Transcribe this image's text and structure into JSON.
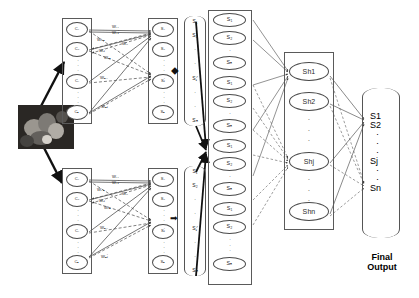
{
  "figure": {
    "background_color": "#ffffff",
    "line_color": "#3a3a3a"
  },
  "input_image": {
    "name": "input-sample-image",
    "description": "grayscale microscopy thumbnail"
  },
  "blocks": [
    {
      "id": "upper-block",
      "input_layer": {
        "label": "cluster-layer",
        "nodes": [
          "C₁",
          "C₂",
          "Cᵢ",
          "Cₙ"
        ],
        "ellipsis": [
          "·",
          "·",
          "·"
        ]
      },
      "output_layer": {
        "label": "score-layer",
        "nodes": [
          "S₁",
          "S₂",
          "Sⱼ",
          "Sₙ"
        ],
        "ellipsis": [
          "·",
          "·",
          "·"
        ]
      },
      "weights": [
        "W₁₁",
        "W₁ⱼ",
        "W₁ₙ",
        "Wᵢ₁",
        "Wᵢⱼ",
        "Wᵢₙ",
        "Wₙ₁",
        "Wₙⱼ"
      ],
      "vector": {
        "items": [
          "S₁",
          "S₂",
          "·",
          "·",
          "Sⱼ'",
          "·",
          "·",
          "Sₙ"
        ]
      },
      "connector_symbol": "⬥"
    },
    {
      "id": "lower-block",
      "input_layer": {
        "label": "cluster-layer",
        "nodes": [
          "C₁",
          "C₂",
          "Cᵢ",
          "Cₙ"
        ],
        "ellipsis": [
          "·",
          "·",
          "·"
        ]
      },
      "output_layer": {
        "label": "score-layer",
        "nodes": [
          "S₁",
          "S₂",
          "Sⱼ",
          "Sₙ"
        ],
        "ellipsis": [
          "·",
          "·",
          "·"
        ]
      },
      "weights": [
        "W₁₁",
        "W₁ⱼ",
        "W₁ₙ",
        "Wᵢ₁",
        "Wᵢⱼ",
        "Wᵢₙ",
        "Wₙ₁",
        "Wₙⱼ"
      ],
      "vector": {
        "items": [
          "S₁",
          "S₂",
          "·",
          "·",
          "Sⱼ'",
          "·",
          "·",
          "Sₙ"
        ]
      },
      "connector_symbol": "➡"
    }
  ],
  "concat_layer": {
    "label": "concatenated-input-layer",
    "nodes": [
      "S₁",
      "S₂",
      "Sₙ",
      "S₁",
      "S₂",
      "Sₙ",
      "S₁",
      "S₂",
      "Sₙ",
      "S₁",
      "S₂",
      "Sₙ"
    ],
    "group_gaps": [
      2,
      5,
      8
    ],
    "tail_ellipsis": [
      "·",
      "·"
    ]
  },
  "hidden_layer": {
    "label": "hidden-layer",
    "nodes": [
      "Sh1",
      "Sh2",
      "Shj",
      "Shn"
    ],
    "ellipsis_upper": [
      "·",
      "·",
      "·"
    ],
    "ellipsis_lower": [
      "·",
      "·",
      "·"
    ]
  },
  "output_layer": {
    "label": "final-output-vector",
    "items": [
      "S1",
      "S2",
      "·",
      "·",
      "·",
      "Sj",
      "·",
      "·",
      "Sn"
    ],
    "caption_line1": "Final",
    "caption_line2": "Output"
  }
}
